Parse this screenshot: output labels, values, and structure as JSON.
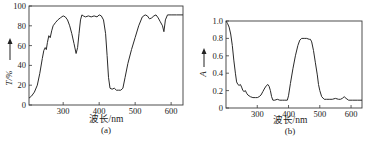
{
  "chart_data": [
    {
      "id": "a",
      "type": "line",
      "caption": "(a)",
      "title": "",
      "xlabel": "波长/nm",
      "ylabel": "T/%",
      "ylabel_arrow": "↑",
      "xlim": [
        205,
        633
      ],
      "ylim": [
        0,
        100
      ],
      "xticks": [
        300,
        400,
        500,
        600
      ],
      "yticks": [
        0,
        20,
        40,
        60,
        80,
        100
      ],
      "grid": false,
      "legend": null,
      "series": [
        {
          "name": "T",
          "x": [
            205,
            212,
            220,
            228,
            235,
            242,
            246,
            250,
            253,
            256,
            260,
            264,
            268,
            272,
            278,
            285,
            292,
            300,
            306,
            312,
            318,
            324,
            330,
            336,
            340,
            344,
            348,
            352,
            356,
            362,
            370,
            378,
            386,
            394,
            400,
            406,
            412,
            418,
            422,
            426,
            430,
            436,
            442,
            448,
            454,
            460,
            466,
            472,
            480,
            490,
            500,
            510,
            520,
            528,
            534,
            540,
            546,
            552,
            558,
            564,
            570,
            576,
            580,
            584,
            590,
            600,
            615,
            633
          ],
          "y": [
            7,
            9,
            13,
            20,
            32,
            47,
            55,
            58,
            56,
            63,
            70,
            68,
            75,
            80,
            83,
            86,
            88,
            90,
            89,
            86,
            80,
            72,
            62,
            52,
            58,
            72,
            86,
            91,
            90,
            89,
            90,
            89,
            90,
            89,
            91,
            90,
            86,
            72,
            50,
            28,
            17,
            16,
            17,
            15,
            15,
            15,
            17,
            28,
            42,
            56,
            68,
            80,
            89,
            91,
            90,
            87,
            88,
            90,
            91,
            88,
            84,
            80,
            74,
            86,
            91,
            91,
            91,
            91
          ]
        }
      ]
    },
    {
      "id": "b",
      "type": "line",
      "caption": "(b)",
      "title": "",
      "xlabel": "波长/nm",
      "ylabel": "A",
      "ylabel_arrow": "↑",
      "xlim": [
        200,
        635
      ],
      "ylim": [
        0,
        1.0
      ],
      "xticks": [
        300,
        400,
        500,
        600
      ],
      "yticks": [
        0,
        0.2,
        0.4,
        0.6,
        0.8,
        1.0
      ],
      "grid": false,
      "legend": null,
      "series": [
        {
          "name": "A",
          "x": [
            200,
            205,
            210,
            215,
            220,
            225,
            230,
            234,
            238,
            242,
            246,
            250,
            254,
            258,
            262,
            266,
            270,
            278,
            286,
            294,
            300,
            306,
            312,
            318,
            324,
            330,
            334,
            338,
            342,
            346,
            350,
            356,
            364,
            372,
            380,
            386,
            392,
            396,
            400,
            406,
            414,
            422,
            430,
            436,
            442,
            450,
            458,
            466,
            470,
            474,
            480,
            486,
            492,
            496,
            500,
            506,
            514,
            522,
            530,
            540,
            550,
            560,
            566,
            572,
            578,
            584,
            592,
            604,
            620,
            635
          ],
          "y": [
            1.0,
            0.97,
            0.93,
            0.85,
            0.72,
            0.55,
            0.4,
            0.3,
            0.27,
            0.26,
            0.27,
            0.24,
            0.2,
            0.19,
            0.2,
            0.17,
            0.15,
            0.13,
            0.12,
            0.12,
            0.12,
            0.13,
            0.15,
            0.19,
            0.23,
            0.26,
            0.27,
            0.25,
            0.2,
            0.13,
            0.09,
            0.09,
            0.1,
            0.09,
            0.09,
            0.09,
            0.09,
            0.09,
            0.14,
            0.28,
            0.45,
            0.6,
            0.72,
            0.78,
            0.8,
            0.8,
            0.8,
            0.79,
            0.79,
            0.76,
            0.66,
            0.52,
            0.38,
            0.27,
            0.2,
            0.13,
            0.1,
            0.1,
            0.1,
            0.1,
            0.11,
            0.1,
            0.1,
            0.11,
            0.13,
            0.11,
            0.09,
            0.09,
            0.09,
            0.09
          ]
        }
      ]
    }
  ],
  "charts": {
    "a": {
      "caption": "(a)",
      "xlabel": "波长/nm",
      "ylabel": "T/%",
      "arrow": "↑",
      "yticklabels": [
        "0",
        "20",
        "40",
        "60",
        "80",
        "100"
      ],
      "xticklabels": [
        "300",
        "400",
        "500",
        "600"
      ]
    },
    "b": {
      "caption": "(b)",
      "xlabel": "波长/nm",
      "ylabel": "A",
      "arrow": "↑",
      "yticklabels": [
        "0",
        "0.2",
        "0.4",
        "0.6",
        "0.8",
        "1.0"
      ],
      "xticklabels": [
        "300",
        "400",
        "500",
        "600"
      ]
    }
  },
  "colors": {
    "line": "#2a2a2a",
    "axis": "#3a3a3a",
    "text": "#222222",
    "background": "#ffffff"
  }
}
